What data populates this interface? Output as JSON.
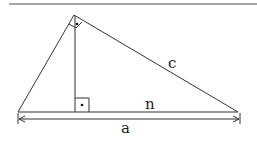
{
  "diagram": {
    "type": "right-triangle-altitude",
    "labels": {
      "hypotenuse_segment": "c",
      "projection": "n",
      "base": "a"
    },
    "markers": [
      "right-angle-apex",
      "right-angle-foot"
    ],
    "colors": {
      "line": "#333333",
      "rule": "#888888"
    }
  }
}
